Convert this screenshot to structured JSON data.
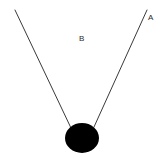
{
  "canvas": {
    "width": 163,
    "height": 158,
    "background_color": "#ffffff"
  },
  "diagram": {
    "type": "line-diagram",
    "stroke_color": "#3a3a3a",
    "stroke_width": 1,
    "shape_fill_color": "#000000",
    "labels": [
      {
        "id": "A",
        "text": "A",
        "x": 148,
        "y": 14,
        "color": "#2b2b2b",
        "font_size": 8
      },
      {
        "id": "B",
        "text": "B",
        "x": 79,
        "y": 35,
        "color": "#2b2b2b",
        "font_size": 8
      }
    ],
    "lines": [
      {
        "id": "left-line",
        "x1": 15,
        "y1": 10,
        "x2": 71,
        "y2": 128
      },
      {
        "id": "right-line",
        "x1": 147,
        "y1": 10,
        "x2": 94,
        "y2": 127
      }
    ],
    "ellipse": {
      "id": "bob",
      "cx": 82,
      "cy": 138,
      "rx": 17,
      "ry": 15,
      "fill": "#000000"
    }
  }
}
